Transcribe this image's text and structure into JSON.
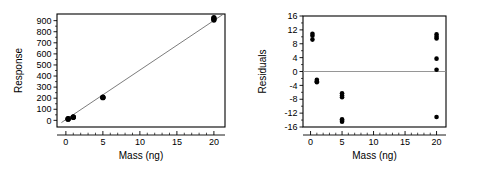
{
  "figure": {
    "panels": [
      "calibration-plot",
      "residual-plot"
    ]
  },
  "chart_data": [
    {
      "id": "calibration-plot",
      "type": "scatter",
      "title": "",
      "xlabel": "Mass (ng)",
      "ylabel": "Response",
      "xlim": [
        -1.2,
        21.5
      ],
      "ylim": [
        -60,
        960
      ],
      "xticks": [
        0,
        5,
        10,
        15,
        20
      ],
      "xticklabels": [
        "0",
        "5",
        "10",
        "15",
        "20"
      ],
      "yticks": [
        0,
        100,
        200,
        300,
        400,
        500,
        600,
        700,
        800,
        900
      ],
      "yticklabels": [
        "0",
        "100",
        "200",
        "300",
        "400",
        "500",
        "600",
        "700",
        "800",
        "900"
      ],
      "grid": false,
      "legend": false,
      "series": [
        {
          "name": "Observed response",
          "marker": "filled-circle",
          "color": "#000000",
          "x": [
            0.3,
            0.3,
            0.3,
            1.0,
            1.0,
            1.0,
            5.0,
            5.0,
            5.0,
            20.0,
            20.0,
            20.0,
            20.0
          ],
          "y": [
            11,
            13,
            15,
            27,
            29,
            31,
            205,
            207,
            209,
            905,
            912,
            920,
            928
          ]
        }
      ],
      "fit_line": {
        "name": "Least-squares fit",
        "color": "#5a5a5a",
        "x": [
          -0.6,
          21.2
        ],
        "y": [
          -20,
          955
        ]
      }
    },
    {
      "id": "residual-plot",
      "type": "scatter",
      "title": "",
      "xlabel": "Mass (ng)",
      "ylabel": "Residuals",
      "xlim": [
        -1.2,
        21.5
      ],
      "ylim": [
        -16,
        16
      ],
      "xticks": [
        0,
        5,
        10,
        15,
        20
      ],
      "xticklabels": [
        "0",
        "5",
        "10",
        "15",
        "20"
      ],
      "yticks": [
        -16,
        -12,
        -8,
        -4,
        0,
        4,
        8,
        12,
        16
      ],
      "yticklabels": [
        "-16",
        "-12",
        "-8",
        "-4",
        "0",
        "4",
        "8",
        "12",
        "16"
      ],
      "grid": false,
      "legend": false,
      "zero_line": {
        "value": 0,
        "color": "#8a8a8a"
      },
      "series": [
        {
          "name": "Residual",
          "marker": "filled-circle",
          "color": "#000000",
          "x": [
            0.3,
            0.3,
            0.3,
            1.0,
            1.0,
            1.0,
            5.0,
            5.0,
            5.0,
            5.0,
            5.0,
            5.0,
            20.0,
            20.0,
            20.0,
            20.0,
            20.0
          ],
          "y": [
            10.9,
            10.3,
            9.2,
            -2.4,
            -2.8,
            -3.1,
            -6.3,
            -6.9,
            -7.4,
            -13.8,
            -14.2,
            -14.5,
            10.7,
            10.0,
            9.5,
            3.7,
            0.5
          ]
        },
        {
          "name": "Residual outlier",
          "marker": "filled-circle",
          "color": "#000000",
          "x": [
            20.0
          ],
          "y": [
            -13.1
          ]
        }
      ]
    }
  ]
}
